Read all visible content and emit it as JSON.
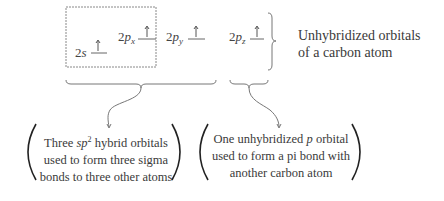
{
  "orbitals": {
    "two_s": {
      "prefix": "2",
      "letter": "s",
      "sub": "",
      "electron": "up-arrow"
    },
    "two_px": {
      "prefix": "2",
      "letter": "p",
      "sub": "x",
      "electron": "up-arrow"
    },
    "two_py": {
      "prefix": "2",
      "letter": "p",
      "sub": "y",
      "electron": "up-arrow"
    },
    "two_pz": {
      "prefix": "2",
      "letter": "p",
      "sub": "z",
      "electron": "up-arrow"
    }
  },
  "right_label": {
    "line1": "Unhybridized orbitals",
    "line2": "of a carbon atom"
  },
  "left_box": {
    "line1_pre": "Three ",
    "line1_italic": "sp",
    "line1_sup": "2",
    "line1_post": " hybrid orbitals",
    "line2": "used to form three sigma",
    "line3": "bonds to three other atoms"
  },
  "right_box": {
    "line1_pre": "One unhybridized ",
    "line1_italic": "p",
    "line1_post": " orbital",
    "line2": "used to form a pi bond with",
    "line3": "another carbon atom"
  },
  "colors": {
    "text": "#3a3a3a",
    "lines": "#777777",
    "parens": "#222222"
  }
}
